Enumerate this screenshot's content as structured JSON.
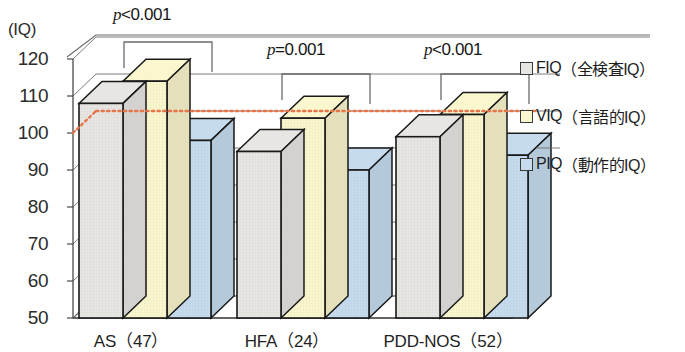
{
  "chart_data": {
    "type": "bar",
    "title": "",
    "subtitle": "",
    "xlabel": "",
    "ylabel": "(IQ)",
    "ylim": [
      50,
      120
    ],
    "ytick_step": 10,
    "yticks": [
      120,
      110,
      100,
      90,
      80,
      70,
      60,
      50
    ],
    "grid": true,
    "projection": "3d-oblique",
    "legend_position": "right",
    "categories": [
      "AS（47）",
      "HFA（24）",
      "PDD-NOS（52）"
    ],
    "series": [
      {
        "name": "FIQ（全検査IQ）",
        "short": "FIQ",
        "color": "#e8e6e3",
        "values": [
          108,
          95,
          99
        ]
      },
      {
        "name": "VIQ（言語的IQ）",
        "short": "VIQ",
        "color": "#faf6cd",
        "values": [
          114,
          104,
          105
        ]
      },
      {
        "name": "PIQ（動作的IQ）",
        "short": "PIQ",
        "color": "#c6dcee",
        "values": [
          98,
          90,
          94
        ]
      }
    ],
    "reference_line": {
      "value": 100,
      "style": "dotted",
      "color": "#e8744a"
    },
    "annotations": [
      {
        "group": "AS（47）",
        "text": "p<0.001",
        "p_operator": "<",
        "p_value": "0.001",
        "compares": [
          "FIQ",
          "PIQ"
        ]
      },
      {
        "group": "HFA（24）",
        "text": "p=0.001",
        "p_operator": "=",
        "p_value": "0.001",
        "compares": [
          "FIQ",
          "PIQ"
        ]
      },
      {
        "group": "PDD-NOS（52）",
        "text": "p<0.001",
        "p_operator": "<",
        "p_value": "0.001",
        "compares": [
          "FIQ",
          "PIQ"
        ]
      }
    ]
  },
  "axis": {
    "unit_label": "(IQ)",
    "tick_120": "120",
    "tick_110": "110",
    "tick_100": "100",
    "tick_90": "90",
    "tick_80": "80",
    "tick_70": "70",
    "tick_60": "60",
    "tick_50": "50"
  },
  "xaxis": {
    "label_0": "AS（47）",
    "label_1": "HFA（24）",
    "label_2": "PDD-NOS（52）"
  },
  "pvalues": {
    "p_as_prefix": "p",
    "p_as_rest": "<0.001",
    "p_hfa_prefix": "p",
    "p_hfa_rest": "=0.001",
    "p_pdd_prefix": "p",
    "p_pdd_rest": "<0.001"
  },
  "legend": {
    "fiq_short": "FIQ",
    "fiq_desc": "（全検査IQ）",
    "viq_short": "VIQ",
    "viq_desc": "（言語的IQ）",
    "piq_short": "PIQ",
    "piq_desc": "（動作的IQ）"
  },
  "colors": {
    "fiq": "#e8e6e3",
    "viq": "#faf6cd",
    "piq": "#c6dcee",
    "reference_line": "#e8744a",
    "outline": "#1a1a1a",
    "grid": "#6e6e6e"
  }
}
